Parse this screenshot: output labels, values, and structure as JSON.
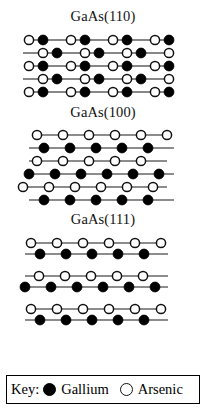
{
  "figure": {
    "caption_none": "",
    "panels": [
      {
        "title": "GaAs(110)",
        "surface": "110",
        "rows": [
          {
            "y": 0,
            "x0": 6,
            "atoms": [
              {
                "t": "as",
                "x": 6
              },
              {
                "t": "ga",
                "x": 20
              },
              {
                "t": "as",
                "x": 48
              },
              {
                "t": "ga",
                "x": 62
              },
              {
                "t": "as",
                "x": 90
              },
              {
                "t": "ga",
                "x": 104
              },
              {
                "t": "as",
                "x": 132
              },
              {
                "t": "ga",
                "x": 146
              }
            ],
            "bonds": [
              [
                6,
                20
              ],
              [
                20,
                48
              ],
              [
                48,
                62
              ],
              [
                62,
                90
              ],
              [
                90,
                104
              ],
              [
                104,
                132
              ],
              [
                132,
                146
              ]
            ]
          },
          {
            "y": 13,
            "x0": 0,
            "atoms": [
              {
                "t": "as",
                "x": 20
              },
              {
                "t": "ga",
                "x": 34
              },
              {
                "t": "as",
                "x": 62
              },
              {
                "t": "ga",
                "x": 76
              },
              {
                "t": "as",
                "x": 104
              },
              {
                "t": "ga",
                "x": 118
              },
              {
                "t": "as",
                "x": 146
              }
            ],
            "bonds": [
              [
                0,
                20
              ],
              [
                20,
                34
              ],
              [
                34,
                62
              ],
              [
                62,
                76
              ],
              [
                76,
                104
              ],
              [
                104,
                118
              ],
              [
                118,
                146
              ]
            ]
          },
          {
            "y": 26,
            "x0": 6,
            "atoms": [
              {
                "t": "as",
                "x": 6
              },
              {
                "t": "ga",
                "x": 20
              },
              {
                "t": "as",
                "x": 48
              },
              {
                "t": "ga",
                "x": 62
              },
              {
                "t": "as",
                "x": 90
              },
              {
                "t": "ga",
                "x": 104
              },
              {
                "t": "as",
                "x": 132
              },
              {
                "t": "ga",
                "x": 146
              }
            ],
            "bonds": [
              [
                6,
                20
              ],
              [
                20,
                48
              ],
              [
                48,
                62
              ],
              [
                62,
                90
              ],
              [
                90,
                104
              ],
              [
                104,
                132
              ],
              [
                132,
                146
              ]
            ]
          },
          {
            "y": 39,
            "x0": 0,
            "atoms": [
              {
                "t": "as",
                "x": 20
              },
              {
                "t": "ga",
                "x": 34
              },
              {
                "t": "as",
                "x": 62
              },
              {
                "t": "ga",
                "x": 76
              },
              {
                "t": "as",
                "x": 104
              },
              {
                "t": "ga",
                "x": 118
              },
              {
                "t": "as",
                "x": 146
              }
            ],
            "bonds": [
              [
                0,
                20
              ],
              [
                20,
                34
              ],
              [
                34,
                62
              ],
              [
                62,
                76
              ],
              [
                76,
                104
              ],
              [
                104,
                118
              ],
              [
                118,
                146
              ]
            ]
          },
          {
            "y": 52,
            "x0": 6,
            "atoms": [
              {
                "t": "as",
                "x": 6
              },
              {
                "t": "ga",
                "x": 20
              },
              {
                "t": "as",
                "x": 48
              },
              {
                "t": "ga",
                "x": 62
              },
              {
                "t": "as",
                "x": 90
              },
              {
                "t": "ga",
                "x": 104
              },
              {
                "t": "as",
                "x": 132
              },
              {
                "t": "ga",
                "x": 146
              }
            ],
            "bonds": [
              [
                6,
                20
              ],
              [
                20,
                48
              ],
              [
                48,
                62
              ],
              [
                62,
                90
              ],
              [
                90,
                104
              ],
              [
                104,
                132
              ],
              [
                132,
                146
              ]
            ]
          }
        ]
      },
      {
        "title": "GaAs(100)",
        "surface": "100",
        "rows": [
          {
            "y": 0,
            "atoms": [
              {
                "t": "as",
                "x": 14
              },
              {
                "t": "as",
                "x": 40
              },
              {
                "t": "as",
                "x": 66
              },
              {
                "t": "as",
                "x": 92
              },
              {
                "t": "as",
                "x": 118
              },
              {
                "t": "as",
                "x": 144
              }
            ],
            "bonds": [
              [
                14,
                144
              ]
            ]
          },
          {
            "y": 13,
            "atoms": [
              {
                "t": "ga",
                "x": 21
              },
              {
                "t": "ga",
                "x": 47
              },
              {
                "t": "ga",
                "x": 73
              },
              {
                "t": "ga",
                "x": 99
              },
              {
                "t": "ga",
                "x": 125
              }
            ],
            "bonds": [
              [
                6,
                151
              ]
            ]
          },
          {
            "y": 26,
            "atoms": [
              {
                "t": "as",
                "x": 14
              },
              {
                "t": "as",
                "x": 40
              },
              {
                "t": "as",
                "x": 66
              },
              {
                "t": "as",
                "x": 92
              },
              {
                "t": "as",
                "x": 118
              }
            ],
            "bonds": [
              [
                6,
                144
              ]
            ]
          },
          {
            "y": 39,
            "atoms": [
              {
                "t": "ga",
                "x": 6
              },
              {
                "t": "ga",
                "x": 32
              },
              {
                "t": "ga",
                "x": 58
              },
              {
                "t": "ga",
                "x": 84
              },
              {
                "t": "ga",
                "x": 110
              },
              {
                "t": "ga",
                "x": 136
              }
            ],
            "bonds": [
              [
                6,
                151
              ]
            ]
          },
          {
            "y": 52,
            "atoms": [
              {
                "t": "as",
                "x": 0
              },
              {
                "t": "as",
                "x": 26
              },
              {
                "t": "as",
                "x": 52
              },
              {
                "t": "as",
                "x": 78
              },
              {
                "t": "as",
                "x": 104
              },
              {
                "t": "as",
                "x": 130
              }
            ],
            "bonds": [
              [
                0,
                144
              ]
            ]
          },
          {
            "y": 65,
            "atoms": [
              {
                "t": "ga",
                "x": 21
              },
              {
                "t": "ga",
                "x": 47
              },
              {
                "t": "ga",
                "x": 73
              },
              {
                "t": "ga",
                "x": 99
              },
              {
                "t": "ga",
                "x": 125
              }
            ],
            "bonds": [
              [
                6,
                151
              ]
            ]
          }
        ]
      },
      {
        "title": "GaAs(111)",
        "surface": "111",
        "rows": [
          {
            "y": 0,
            "atoms": [
              {
                "t": "as",
                "x": 8
              },
              {
                "t": "as",
                "x": 34
              },
              {
                "t": "as",
                "x": 60
              },
              {
                "t": "as",
                "x": 86
              },
              {
                "t": "as",
                "x": 112
              },
              {
                "t": "as",
                "x": 138
              }
            ],
            "bonds": [
              [
                8,
                138
              ]
            ]
          },
          {
            "y": 11,
            "atoms": [
              {
                "t": "ga",
                "x": 17
              },
              {
                "t": "ga",
                "x": 43
              },
              {
                "t": "ga",
                "x": 69
              },
              {
                "t": "ga",
                "x": 95
              },
              {
                "t": "ga",
                "x": 121
              }
            ],
            "bonds": [
              [
                2,
                145
              ]
            ]
          },
          {
            "y": 33,
            "atoms": [
              {
                "t": "as",
                "x": 16
              },
              {
                "t": "as",
                "x": 42
              },
              {
                "t": "as",
                "x": 68
              },
              {
                "t": "as",
                "x": 94
              },
              {
                "t": "as",
                "x": 120
              }
            ],
            "bonds": [
              [
                2,
                145
              ]
            ]
          },
          {
            "y": 44,
            "atoms": [
              {
                "t": "ga",
                "x": 2
              },
              {
                "t": "ga",
                "x": 28
              },
              {
                "t": "ga",
                "x": 54
              },
              {
                "t": "ga",
                "x": 80
              },
              {
                "t": "ga",
                "x": 106
              },
              {
                "t": "ga",
                "x": 132
              }
            ],
            "bonds": [
              [
                2,
                145
              ]
            ]
          },
          {
            "y": 66,
            "atoms": [
              {
                "t": "as",
                "x": 8
              },
              {
                "t": "as",
                "x": 34
              },
              {
                "t": "as",
                "x": 60
              },
              {
                "t": "as",
                "x": 86
              },
              {
                "t": "as",
                "x": 112
              },
              {
                "t": "as",
                "x": 138
              }
            ],
            "bonds": [
              [
                8,
                138
              ]
            ]
          },
          {
            "y": 77,
            "atoms": [
              {
                "t": "ga",
                "x": 17
              },
              {
                "t": "ga",
                "x": 43
              },
              {
                "t": "ga",
                "x": 69
              },
              {
                "t": "ga",
                "x": 95
              },
              {
                "t": "ga",
                "x": 121
              }
            ],
            "bonds": [
              [
                2,
                145
              ]
            ]
          }
        ]
      }
    ]
  },
  "key": {
    "label": "Key:",
    "gallium_symbol": "filled-circle",
    "gallium_text": "Gallium",
    "arsenic_symbol": "open-circle",
    "arsenic_text": "Arsenic"
  },
  "colors": {
    "gallium": "#000000",
    "arsenic": "#ffffff",
    "outline": "#111111",
    "bond": "#1a1a1a",
    "background": "#ffffff"
  }
}
